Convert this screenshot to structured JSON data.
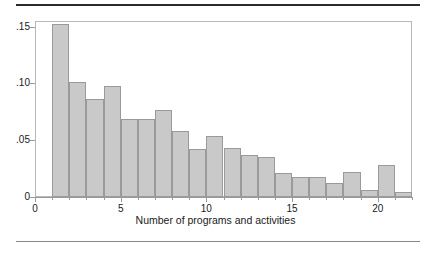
{
  "chart_data": {
    "type": "bar",
    "title": "",
    "subtitle": "",
    "xlabel": "Number of programs and activities",
    "ylabel": "",
    "xlim": [
      0,
      22
    ],
    "ylim": [
      0,
      0.155
    ],
    "grid": false,
    "legend": null,
    "x_ticks": [
      "0",
      "5",
      "10",
      "15",
      "20"
    ],
    "x_tick_values": [
      0,
      5,
      10,
      15,
      20
    ],
    "y_ticks": [
      ".15",
      ".10",
      ".05",
      "0"
    ],
    "y_tick_values": [
      0.15,
      0.1,
      0.05,
      0
    ],
    "bin_width": 1,
    "bin_starts": [
      1,
      2,
      3,
      4,
      5,
      6,
      7,
      8,
      9,
      10,
      11,
      12,
      13,
      14,
      15,
      16,
      17,
      18,
      19,
      20,
      21
    ],
    "categories": [
      "1-2",
      "2-3",
      "3-4",
      "4-5",
      "5-6",
      "6-7",
      "7-8",
      "8-9",
      "9-10",
      "10-11",
      "11-12",
      "12-13",
      "13-14",
      "14-15",
      "15-16",
      "16-17",
      "17-18",
      "18-19",
      "19-20",
      "20-21",
      "21-22"
    ],
    "values": [
      0.152,
      0.101,
      0.086,
      0.098,
      0.069,
      0.069,
      0.077,
      0.058,
      0.042,
      0.054,
      0.043,
      0.037,
      0.035,
      0.021,
      0.018,
      0.018,
      0.012,
      0.022,
      0.006,
      0.028,
      0.004
    ],
    "colors": {
      "bar_fill": "#c9c9c9",
      "bar_stroke": "#9a9a9a",
      "frame": "#b9b9b9",
      "axis": "#9a9a9a",
      "text": "#1a1a1a",
      "rule_top": "#2b2b2b",
      "rule_bottom": "#8a8a8a",
      "background": "#ffffff"
    }
  }
}
